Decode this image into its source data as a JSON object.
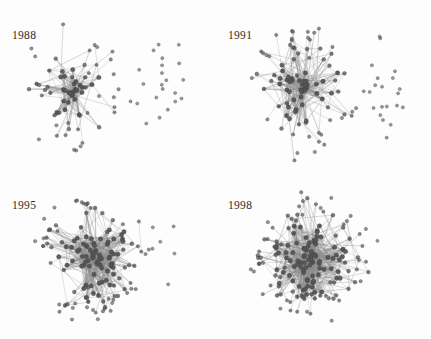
{
  "figure": {
    "background_color": "#fdfdfd",
    "layout": "2x2 grid of node-link diagrams",
    "width": 431,
    "height": 339
  },
  "style": {
    "node_color": "#555555",
    "node_stroke": "#3d3d3d",
    "edge_color": "#8a8a8a",
    "label_color": "#2b2b2b",
    "node_radius": 1.9,
    "edge_width": 0.45
  },
  "panels": [
    {
      "id": "panel-1988",
      "year_label": "1988",
      "label_x": 12,
      "label_y": 30,
      "chart_data": {
        "type": "scatter",
        "title": "1988",
        "description": "Sparse collaboration network, left-leaning dense hub with long radial ties and many unconnected nodes at right",
        "node_count": 96,
        "edge_count": 210,
        "isolated_count": 22,
        "connected_count": 74,
        "seed": 1988,
        "core": {
          "cx": 72,
          "cy": 92,
          "rx": 46,
          "ry": 62
        },
        "isolate_zone": {
          "cx": 162,
          "cy": 92,
          "rx": 30,
          "ry": 52
        },
        "density": 0.055,
        "hub_bias": 0.74,
        "long_edge_rate": 0.3
      }
    },
    {
      "id": "panel-1991",
      "year_label": "1991",
      "label_x": 12,
      "label_y": 30,
      "chart_data": {
        "type": "scatter",
        "title": "1991",
        "description": "Denser central cluster than 1988 with a distinct column of isolated nodes on the right",
        "node_count": 118,
        "edge_count": 360,
        "isolated_count": 21,
        "connected_count": 97,
        "seed": 1991,
        "core": {
          "cx": 86,
          "cy": 90,
          "rx": 56,
          "ry": 64
        },
        "isolate_zone": {
          "cx": 166,
          "cy": 88,
          "rx": 22,
          "ry": 52
        },
        "density": 0.077,
        "hub_bias": 0.62,
        "long_edge_rate": 0.22
      }
    },
    {
      "id": "panel-1995",
      "year_label": "1995",
      "label_x": 12,
      "label_y": 30,
      "chart_data": {
        "type": "scatter",
        "title": "1995",
        "description": "Large dense round giant component, only a handful of isolated nodes remain at right",
        "node_count": 150,
        "edge_count": 640,
        "isolated_count": 6,
        "connected_count": 144,
        "seed": 1995,
        "core": {
          "cx": 92,
          "cy": 86,
          "rx": 58,
          "ry": 62
        },
        "isolate_zone": {
          "cx": 168,
          "cy": 80,
          "rx": 18,
          "ry": 40
        },
        "density": 0.058,
        "hub_bias": 0.4,
        "long_edge_rate": 0.14
      }
    },
    {
      "id": "panel-1998",
      "year_label": "1998",
      "label_x": 12,
      "label_y": 30,
      "chart_data": {
        "type": "scatter",
        "title": "1998",
        "description": "Densest network, fully connected giant component with radiating spoke edges to peripheral nodes",
        "node_count": 168,
        "edge_count": 820,
        "isolated_count": 1,
        "connected_count": 167,
        "seed": 1998,
        "core": {
          "cx": 94,
          "cy": 88,
          "rx": 58,
          "ry": 60
        },
        "isolate_zone": {
          "cx": 172,
          "cy": 70,
          "rx": 12,
          "ry": 26
        },
        "density": 0.059,
        "hub_bias": 0.38,
        "long_edge_rate": 0.17
      }
    }
  ]
}
